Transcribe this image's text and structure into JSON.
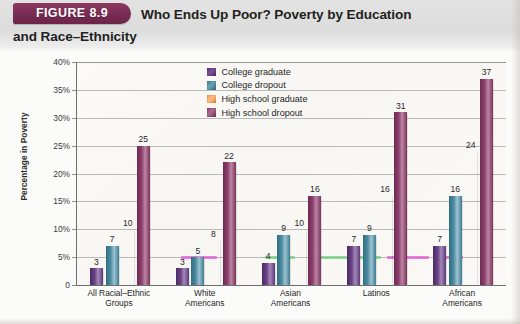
{
  "figure": {
    "badge_label": "FIGURE 8.9",
    "title_line1": "Who Ends Up Poor? Poverty by Education",
    "title_line2": "and Race–Ethnicity"
  },
  "colors": {
    "badge": "#7b2d55",
    "college_graduate": "#5b3378",
    "college_dropout": "#3d7d92",
    "high_school_graduate": "#f0a25b",
    "high_school_dropout": "#8d4470",
    "gridline": "#b9b9b9",
    "axis": "#6f6f6f",
    "highlight_magenta": "#e352d6",
    "highlight_green": "#6ccf7a"
  },
  "chart_data": {
    "type": "bar",
    "title": "Who Ends Up Poor? Poverty by Education and Race–Ethnicity",
    "xlabel": "",
    "ylabel": "Percentage in Poverty",
    "ylim": [
      0,
      40
    ],
    "yticks": [
      "0",
      "5%",
      "10%",
      "15%",
      "20%",
      "25%",
      "30%",
      "35%",
      "40%"
    ],
    "ytick_values": [
      0,
      5,
      10,
      15,
      20,
      25,
      30,
      35,
      40
    ],
    "grid": true,
    "legend_position": "top-center",
    "categories": [
      "All Racial–Ethnic Groups",
      "White Americans",
      "Asian Americans",
      "Latinos",
      "African Americans"
    ],
    "category_lines": [
      [
        "All Racial–Ethnic",
        "Groups"
      ],
      [
        "White",
        "Americans"
      ],
      [
        "Asian",
        "Americans"
      ],
      [
        "Latinos",
        ""
      ],
      [
        "African",
        "Americans"
      ]
    ],
    "series": [
      {
        "name": "College graduate",
        "values": [
          3,
          3,
          4,
          7,
          7
        ]
      },
      {
        "name": "College dropout",
        "values": [
          7,
          5,
          9,
          9,
          16
        ]
      },
      {
        "name": "High school graduate",
        "values": [
          10,
          8,
          10,
          16,
          24
        ]
      },
      {
        "name": "High school dropout",
        "values": [
          25,
          22,
          16,
          31,
          37
        ]
      }
    ]
  }
}
